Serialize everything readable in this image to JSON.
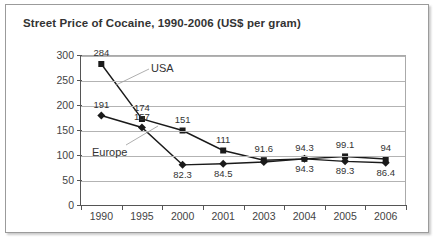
{
  "chart_data": {
    "type": "line",
    "title": "Street Price of Cocaine, 1990-2006 (US$ per gram)",
    "xlabel": "",
    "ylabel": "",
    "categories": [
      "1990",
      "1995",
      "2000",
      "2001",
      "2003",
      "2004",
      "2005",
      "2006"
    ],
    "ylim": [
      0,
      300
    ],
    "yticks": [
      0,
      50,
      100,
      150,
      200,
      250,
      300
    ],
    "ytick_labels": [
      "0",
      "50",
      "100",
      "150",
      "200",
      "250",
      "300"
    ],
    "grid": true,
    "legend": "inline-annotations",
    "series": [
      {
        "name": "USA",
        "marker": "square",
        "color": "#1a1a1a",
        "values": [
          284,
          174,
          151,
          111,
          91.6,
          94.3,
          99.1,
          94
        ],
        "labels": [
          "284",
          "174",
          "151",
          "111",
          "91.6",
          "94.3",
          "99.1",
          "94"
        ]
      },
      {
        "name": "Europe",
        "marker": "diamond",
        "color": "#1a1a1a",
        "values": [
          181,
          157,
          82.3,
          84.5,
          88,
          94.3,
          89.3,
          86.4
        ],
        "labels": [
          "191",
          "157",
          "82.3",
          "84.5",
          "",
          "94.3",
          "89.3",
          "86.4"
        ]
      }
    ],
    "annotations": [
      {
        "text": "USA",
        "series": "USA"
      },
      {
        "text": "Europe",
        "series": "Europe"
      }
    ]
  }
}
